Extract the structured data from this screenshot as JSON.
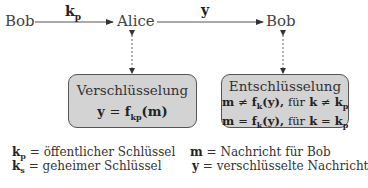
{
  "diagram": {
    "nodes": {
      "sender": "Bob",
      "middle": "Alice",
      "receiver": "Bob"
    },
    "edges": [
      {
        "from": "Bob",
        "to": "Alice",
        "label_base": "k",
        "label_sub": "p"
      },
      {
        "from": "Alice",
        "to": "Bob",
        "label_base": "y",
        "label_sub": ""
      }
    ],
    "encryption_box": {
      "title": "Verschlüsselung",
      "equation_lhs": "y",
      "equation_op": "=",
      "equation_f": "f",
      "equation_sub": "kp",
      "equation_arg": "(m)"
    },
    "decryption_box": {
      "title": "Entschlüsselung",
      "line1": {
        "lhs": "m",
        "op": "≠",
        "f": "f",
        "sub": "k",
        "arg": "(y),",
        "fuer": "für",
        "cond_lhs": "k",
        "cond_op": "≠",
        "cond_rhs": "k",
        "cond_rhs_sub": "p"
      },
      "line2": {
        "lhs": "m",
        "op": "=",
        "f": "f",
        "sub": "k",
        "arg": "(y),",
        "fuer": "für",
        "cond_lhs": "k",
        "cond_op": "=",
        "cond_rhs": "k",
        "cond_rhs_sub": "p"
      }
    },
    "legend": {
      "left": [
        {
          "sym": "k",
          "sub": "p",
          "eq": "=",
          "text": "öffentlicher Schlüssel"
        },
        {
          "sym": "k",
          "sub": "s",
          "eq": "=",
          "text": "geheimer Schlüssel"
        }
      ],
      "right": [
        {
          "sym": "m",
          "eq": "=",
          "text": "Nachricht für Bob"
        },
        {
          "sym": "y",
          "eq": "=",
          "text": "verschlüsselte Nachricht"
        }
      ]
    },
    "colors": {
      "box_fill": "#d3d3d3",
      "box_border": "#555555",
      "arrow": "#333333"
    }
  }
}
